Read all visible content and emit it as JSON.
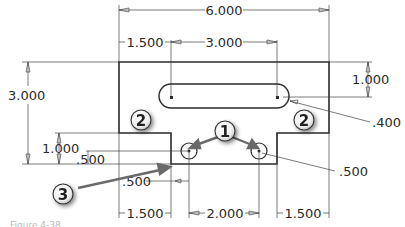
{
  "drawing": {
    "dimensions": {
      "overall_width": "6.000",
      "left_offset": "1.500",
      "slot_length": "3.000",
      "overall_height": "3.000",
      "slot_from_top": "1.000",
      "slot_radius": ".400",
      "step_height": "1.000",
      "hole_height": ".500",
      "hole_offset_x": ".500",
      "hole_diameter": ".500",
      "bottom_left": "1.500",
      "hole_spacing": "2.000",
      "bottom_right": "1.500"
    },
    "callouts": [
      "1",
      "2",
      "2",
      "3"
    ],
    "caption": "Figure 4-38"
  },
  "colors": {
    "line": "#2a2a2a",
    "callout_fill": "#f4f4f4",
    "arrow": "#6a6a6a"
  }
}
